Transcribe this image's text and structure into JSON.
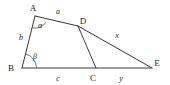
{
  "figure": {
    "background_color": "#ffffff",
    "stroke_color": "#3a3a3a",
    "text_color": "#2b2b2b",
    "vertices": [
      {
        "id": "A",
        "label": "A",
        "x": 35,
        "y": 16,
        "label_x": 33,
        "label_y": 11
      },
      {
        "id": "B",
        "label": "B",
        "x": 22,
        "y": 68,
        "label_x": 11,
        "label_y": 71
      },
      {
        "id": "C",
        "label": "C",
        "x": 96,
        "y": 68,
        "label_x": 93,
        "label_y": 81
      },
      {
        "id": "D",
        "label": "D",
        "x": 78,
        "y": 26,
        "label_x": 80,
        "label_y": 24
      },
      {
        "id": "E",
        "label": "E",
        "x": 152,
        "y": 68,
        "label_x": 154,
        "label_y": 66
      }
    ],
    "edges": [
      {
        "id": "AB",
        "from": "A",
        "to": "B"
      },
      {
        "id": "AD",
        "from": "A",
        "to": "D"
      },
      {
        "id": "DE",
        "from": "D",
        "to": "E"
      },
      {
        "id": "DC",
        "from": "D",
        "to": "C"
      },
      {
        "id": "BE",
        "from": "B",
        "to": "E"
      }
    ],
    "side_labels": [
      {
        "id": "a",
        "text": "a",
        "edge": "AD",
        "x": 58,
        "y": 14
      },
      {
        "id": "b",
        "text": "b",
        "edge": "AB",
        "x": 21,
        "y": 40
      },
      {
        "id": "c",
        "text": "c",
        "edge": "BC",
        "x": 58,
        "y": 81
      },
      {
        "id": "x",
        "text": "x",
        "edge": "DE",
        "x": 117,
        "y": 38
      },
      {
        "id": "y",
        "text": "y",
        "edge": "CE",
        "x": 121,
        "y": 81
      }
    ],
    "angle_labels": [
      {
        "id": "alpha",
        "text": "α",
        "vertex": "A",
        "x": 40,
        "y": 28
      },
      {
        "id": "beta",
        "text": "β",
        "vertex": "B",
        "x": 35,
        "y": 59
      }
    ],
    "angle_arcs": [
      {
        "id": "alpha-arc",
        "vertex": "A",
        "path": "M 32.6 27.8 A 12 12 0 0 0 45.8 22.3"
      },
      {
        "id": "beta-arc",
        "vertex": "B",
        "path": "M 36.5 67.6 A 14.5 14.5 0 0 0 25.8 54.0"
      }
    ]
  }
}
